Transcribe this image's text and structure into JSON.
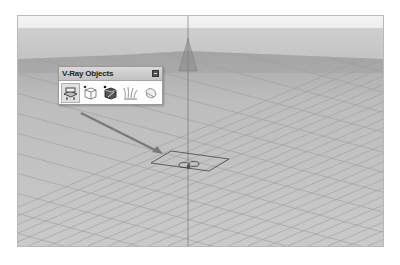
{
  "toolbar": {
    "title": "V-Ray Objects",
    "close_label": "close",
    "buttons": [
      {
        "id": "infinite-plane",
        "icon": "infinite-plane-icon",
        "active": true
      },
      {
        "id": "proxy-export",
        "icon": "proxy-export-icon",
        "active": false
      },
      {
        "id": "proxy-import",
        "icon": "proxy-import-icon",
        "active": false
      },
      {
        "id": "fur",
        "icon": "fur-icon",
        "active": false
      },
      {
        "id": "mesh-clipper",
        "icon": "mesh-clipper-icon",
        "active": false
      }
    ]
  },
  "viewport": {
    "background": "#c9c9c9",
    "grid_color": "#a8a8a8",
    "object": "infinite-plane",
    "annotation": "arrow-from-toolbar-to-plane"
  },
  "colors": {
    "toolbar_title_bg": "#c8c8c8",
    "arrow": "#7a7a7a",
    "axis": "#555555"
  }
}
